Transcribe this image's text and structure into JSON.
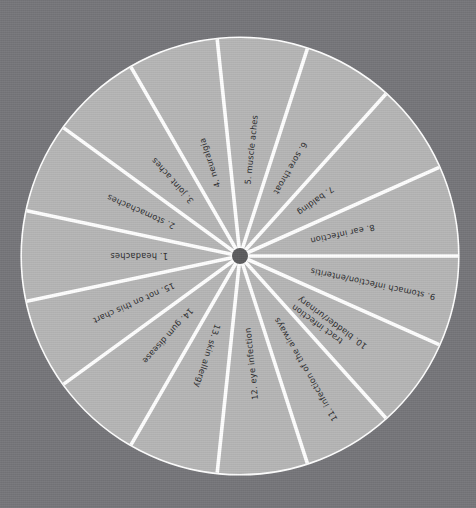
{
  "chart_data": {
    "type": "pie",
    "title": "",
    "subtitle": "",
    "xlabel": "",
    "ylabel": "",
    "legend_position": "none",
    "grid": false,
    "note": "Equal-area 15-slice radial selection wheel of ailments; every slice is 24 degrees (100/15 = 6.667% each).",
    "categories": [
      "1. headaches",
      "2. stomachaches",
      "3. joint aches",
      "4. neuralgia",
      "5. muscle aches",
      "6. sore throat",
      "7. balding",
      "8. ear infection",
      "9. stomach infection/enteritis",
      "10. bladder/urinary tract infection",
      "11. infection of the airways",
      "12. eye infection",
      "13. skin allergy",
      "14. gum disease",
      "15. not on this chart"
    ],
    "values": [
      6.667,
      6.667,
      6.667,
      6.667,
      6.667,
      6.667,
      6.667,
      6.667,
      6.667,
      6.667,
      6.667,
      6.667,
      6.667,
      6.667,
      6.667
    ],
    "slice_angle_degrees": 24,
    "slice_count": 15
  },
  "wheel": {
    "center_x": 240,
    "center_y": 256,
    "radius": 218,
    "hub_radius": 8,
    "label_inner_radius": 72,
    "divider_width": 3.6,
    "colors": {
      "background": "#76767a",
      "sector_fill": "#b6b6b6",
      "divider": "#ffffff",
      "hub": "#5c5c5e",
      "label_text": "#2a2a2c",
      "rim": "#ffffff"
    },
    "sectors": [
      {
        "index": 1,
        "number": "1.",
        "label": "1.  headaches",
        "name": "headaches",
        "start_angle": 168,
        "end_angle": 192,
        "flip": false
      },
      {
        "index": 2,
        "number": "2.",
        "label": "2.  stomachaches",
        "name": "stomachaches",
        "start_angle": 192,
        "end_angle": 216,
        "flip": false
      },
      {
        "index": 3,
        "number": "3.",
        "label": "3.  joint aches",
        "name": "joint aches",
        "start_angle": 216,
        "end_angle": 240,
        "flip": false
      },
      {
        "index": 4,
        "number": "4.",
        "label": "4.  neuralgia",
        "name": "neuralgia",
        "start_angle": 240,
        "end_angle": 264,
        "flip": false
      },
      {
        "index": 5,
        "number": "5.",
        "label": "5.  muscle aches",
        "name": "muscle aches",
        "start_angle": 264,
        "end_angle": 288,
        "flip": false
      },
      {
        "index": 6,
        "number": "6.",
        "label": "6.  sore throat",
        "name": "sore throat",
        "start_angle": 288,
        "end_angle": 312,
        "flip": true
      },
      {
        "index": 7,
        "number": "7.",
        "label": "7.  balding",
        "name": "balding",
        "start_angle": 312,
        "end_angle": 336,
        "flip": true
      },
      {
        "index": 8,
        "number": "8.",
        "label": "8.  ear infection",
        "name": "ear infection",
        "start_angle": 336,
        "end_angle": 360,
        "flip": true
      },
      {
        "index": 9,
        "number": "9.",
        "label": "9.  stomach infection/enteritis",
        "name": "stomach infection/enteritis",
        "start_angle": 0,
        "end_angle": 24,
        "flip": true
      },
      {
        "index": 10,
        "number": "10.",
        "label": "10.  bladder/urinary",
        "label2": "tract infection",
        "name": "bladder/urinary tract infection",
        "start_angle": 24,
        "end_angle": 48,
        "flip": true
      },
      {
        "index": 11,
        "number": "11.",
        "label": "11.  infection of the airways",
        "name": "infection of the airways",
        "start_angle": 48,
        "end_angle": 72,
        "flip": true
      },
      {
        "index": 12,
        "number": "12.",
        "label": "12.  eye infection",
        "name": "eye infection",
        "start_angle": 72,
        "end_angle": 96,
        "flip": true
      },
      {
        "index": 13,
        "number": "13.",
        "label": "13.  skin allergy",
        "name": "skin allergy",
        "start_angle": 96,
        "end_angle": 120,
        "flip": false
      },
      {
        "index": 14,
        "number": "14.",
        "label": "14.  gum disease",
        "name": "gum disease",
        "start_angle": 120,
        "end_angle": 144,
        "flip": false
      },
      {
        "index": 15,
        "number": "15.",
        "label": "15.  not on this chart",
        "name": "not on this chart",
        "start_angle": 144,
        "end_angle": 168,
        "flip": false
      }
    ]
  }
}
